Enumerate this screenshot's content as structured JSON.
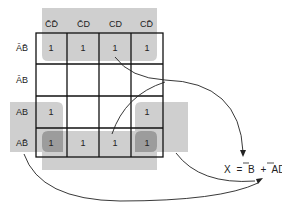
{
  "diagram": {
    "type": "karnaugh-map",
    "column_headers": [
      "C̄D̄",
      "C̄D",
      "CD",
      "CD̄"
    ],
    "row_headers": [
      "ĀB̄",
      "ĀB",
      "AB",
      "AB̄"
    ],
    "cells": [
      [
        "1",
        "1",
        "1",
        "1"
      ],
      [
        "",
        "",
        "",
        ""
      ],
      [
        "1",
        "",
        "",
        "1"
      ],
      [
        "1",
        "1",
        "1",
        "1"
      ]
    ],
    "groups": [
      {
        "name": "B-bar",
        "description": "Top row and bottom row (wrap-around)",
        "term": "B̄"
      },
      {
        "name": "AD-bar",
        "description": "Left and right columns of rows AB and AB̄ (wrap-around)",
        "term": "AD̄"
      }
    ],
    "equation": {
      "lhs": "X",
      "equals": "=",
      "term1": "B",
      "plus": "+",
      "term2_a": "A",
      "term2_d": "D"
    },
    "colors": {
      "shading": "#cfcfcf",
      "overlap": "#9c9c9c",
      "grid": "#111111"
    }
  }
}
